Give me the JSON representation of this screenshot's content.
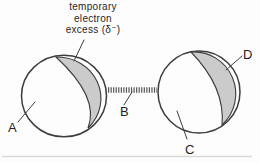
{
  "figure": {
    "caption_lines": {
      "line1": "temporary",
      "line2": "electron",
      "line3": "excess (δ⁻)"
    },
    "labels": {
      "left_atom": "A",
      "attraction": "B",
      "right_atom": "C",
      "right_shading": "D"
    }
  },
  "colors": {
    "shading": "#cbcbcb",
    "outline": "#3d3d3d",
    "text": "#1f1f1f",
    "background": "#fdfdfd"
  }
}
